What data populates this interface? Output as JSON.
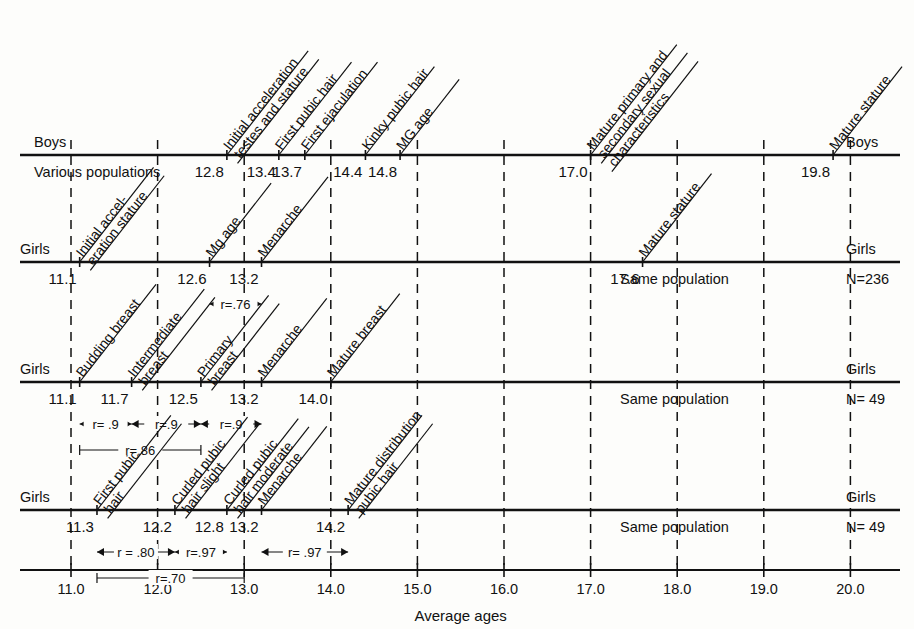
{
  "figure": {
    "x_axis_title": "Average ages",
    "x_ticks": [
      "11.0",
      "12.0",
      "13.0",
      "14.0",
      "15.0",
      "16.0",
      "17.0",
      "18.0",
      "19.0",
      "20.0"
    ]
  },
  "chart_data": {
    "type": "scatter",
    "title": "Average ages",
    "xlabel": "Average ages",
    "ylabel": "",
    "xlim": [
      10.8,
      20.5
    ],
    "grid": true,
    "legend": "none",
    "x_ticks": [
      11.0,
      12.0,
      13.0,
      14.0,
      15.0,
      16.0,
      17.0,
      18.0,
      19.0,
      20.0
    ],
    "x_tick_labels": [
      "11.0",
      "12.0",
      "13.0",
      "14.0",
      "15.0",
      "16.0",
      "17.0",
      "18.0",
      "19.0",
      "20.0"
    ],
    "series": [
      {
        "name": "Boys — Various populations",
        "row_label_left": "Boys",
        "row_label_right": "Boys",
        "population_note": "Various populations",
        "population_note_side": "left",
        "points": [
          {
            "event": "Initial acceleration testes and stature",
            "value": 12.8,
            "label": "12.8"
          },
          {
            "event": "First pubic hair",
            "value": 13.4,
            "label": "13.4"
          },
          {
            "event": "First ejaculation",
            "value": 13.7,
            "label": "13.7"
          },
          {
            "event": "Kinky pubic hair",
            "value": 14.4,
            "label": "14.4"
          },
          {
            "event": "MG age",
            "value": 14.8,
            "label": "14.8"
          },
          {
            "event": "Mature primary and secondary sexual characteristics",
            "value": 17.0,
            "label": "17.0"
          },
          {
            "event": "Mature stature",
            "value": 19.8,
            "label": "19.8"
          }
        ],
        "correlations": []
      },
      {
        "name": "Girls — Same population N=236",
        "row_label_left": "Girls",
        "row_label_right": "Girls",
        "population_note": "Same population",
        "population_note_side": "right",
        "n_label": "N=236",
        "points": [
          {
            "event": "Initial acceleration stature",
            "value": 11.1,
            "label": "11.1"
          },
          {
            "event": "Mg age",
            "value": 12.6,
            "label": "12.6"
          },
          {
            "event": "Menarche",
            "value": 13.2,
            "label": "13.2"
          },
          {
            "event": "Mature stature",
            "value": 17.6,
            "label": "17.6"
          }
        ],
        "correlations": [
          {
            "label": "r=.76",
            "from": 12.6,
            "to": 13.2,
            "level": 0
          }
        ]
      },
      {
        "name": "Girls — breast stages, Same population N=49",
        "row_label_left": "Girls",
        "row_label_right": "Girls",
        "population_note": "Same population",
        "population_note_side": "right",
        "n_label": "N= 49",
        "points": [
          {
            "event": "Budding breast",
            "value": 11.1,
            "label": "11.1"
          },
          {
            "event": "Intermediate breast",
            "value": 11.7,
            "label": "11.7"
          },
          {
            "event": "Primary breast",
            "value": 12.5,
            "label": "12.5"
          },
          {
            "event": "Menarche",
            "value": 13.2,
            "label": "13.2"
          },
          {
            "event": "Mature breast",
            "value": 14.0,
            "label": "14.0"
          }
        ],
        "correlations": [
          {
            "label": "r= .9",
            "from": 11.1,
            "to": 11.7,
            "level": 0
          },
          {
            "label": "r=.9",
            "from": 11.7,
            "to": 12.5,
            "level": 0
          },
          {
            "label": "r=.9",
            "from": 12.5,
            "to": 13.2,
            "level": 0
          },
          {
            "label": "r=.86",
            "from": 11.1,
            "to": 12.5,
            "level": 1
          }
        ]
      },
      {
        "name": "Girls — pubic hair stages, Same population N=49",
        "row_label_left": "Girls",
        "row_label_right": "Girls",
        "population_note": "Same population",
        "population_note_side": "right",
        "n_label": "N= 49",
        "points": [
          {
            "event": "First pubic hair",
            "value": 11.3,
            "label": "11.3"
          },
          {
            "event": "Curled pubic hair slight",
            "value": 12.2,
            "label": "12.2"
          },
          {
            "event": "Curled pubic hair moderate",
            "value": 12.8,
            "label": "12.8"
          },
          {
            "event": "Menarche",
            "value": 13.2,
            "label": "13.2"
          },
          {
            "event": "Mature distribution pubic hair",
            "value": 14.2,
            "label": "14.2"
          }
        ],
        "correlations": [
          {
            "label": "r = .80",
            "from": 11.3,
            "to": 12.2,
            "level": 0
          },
          {
            "label": "r=.97",
            "from": 12.2,
            "to": 12.8,
            "level": 0
          },
          {
            "label": "r= .97",
            "from": 13.2,
            "to": 14.2,
            "level": 0
          },
          {
            "label": "r=.70",
            "from": 11.3,
            "to": 13.0,
            "level": 1
          }
        ]
      }
    ]
  },
  "rows": [
    {
      "left": "Boys",
      "right": "Boys",
      "note": "Various populations",
      "n": "",
      "values": [
        "12.8",
        "13.4",
        "13.7",
        "14.4",
        "14.8",
        "17.0",
        "19.8"
      ],
      "events": [
        "Initial acceleration",
        "testes and stature",
        "First pubic hair",
        "First ejaculation",
        "Kinky pubic hair",
        "MG age",
        "Mature primary and",
        "secondary sexual",
        "characteristics",
        "Mature stature"
      ]
    },
    {
      "left": "Girls",
      "right": "Girls",
      "note": "Same population",
      "n": "N=236",
      "values": [
        "11.1",
        "12.6",
        "13.2",
        "17.6"
      ],
      "events": [
        "Initial accel-",
        "eration stature",
        "Mg age",
        "Menarche",
        "Mature stature"
      ],
      "r": [
        "r=.76"
      ]
    },
    {
      "left": "Girls",
      "right": "Girls",
      "note": "Same population",
      "n": "N= 49",
      "values": [
        "11.1",
        "11.7",
        "12.5",
        "13.2",
        "14.0"
      ],
      "events": [
        "Budding breast",
        "Intermediate",
        "breast",
        "Primary",
        "breast",
        "Menarche",
        "Mature breast"
      ],
      "r": [
        "r= .9",
        "r=.9",
        "r=.9",
        "r=.86"
      ]
    },
    {
      "left": "Girls",
      "right": "Girls",
      "note": "Same population",
      "n": "N= 49",
      "values": [
        "11.3",
        "12.2",
        "12.8",
        "13.2",
        "14.2"
      ],
      "events": [
        "First pubic",
        "hair",
        "Curled pubic",
        "hair slight",
        "Curled pubic",
        "hair moderate",
        "Menarche",
        "Mature distribution",
        "pubic hair"
      ],
      "r": [
        "r = .80",
        "r=.97",
        "r= .97",
        "r=.70"
      ]
    }
  ]
}
